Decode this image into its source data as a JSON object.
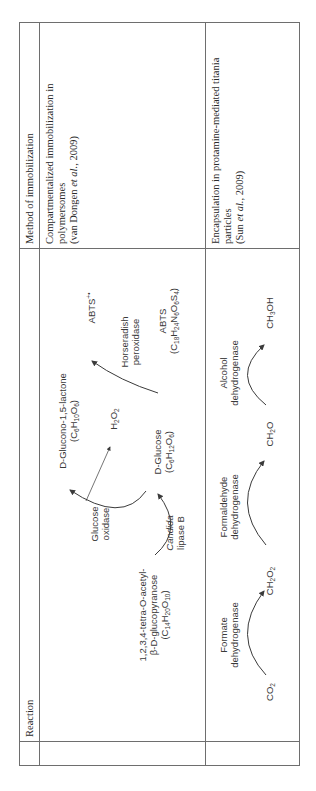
{
  "table": {
    "headers": {
      "reaction": "Reaction",
      "method": "Method of immobilization"
    },
    "rows": [
      {
        "method_lines": [
          "Compartmentalized immobilization in",
          "polymersomes"
        ],
        "citation_prefix": "(van Dongen ",
        "citation_italic": "et al.",
        "citation_suffix": ", 2009)",
        "reaction": {
          "substrate_line1": "1,2,3,4-tetra-O-acetyl-",
          "substrate_line2": "β-D-glucopyranose",
          "substrate_formula": "(C14H20O10)",
          "enzyme1_line1": "Candida",
          "enzyme1_line2": "lipase B",
          "intermediate": "D-Glucose",
          "intermediate_formula": "(C6H12O6)",
          "enzyme2_line1": "Glucose",
          "enzyme2_line2": "oxidase",
          "product": "D-Glucono-1,5-lactone",
          "product_formula": "(C6H10O6)",
          "byproduct": "H2O2",
          "enzyme3_line1": "Horseradish",
          "enzyme3_line2": "peroxidase",
          "dye": "ABTS",
          "dye_formula": "(C18H24N6O6S4)",
          "dye_oxidized": "ABTS+•"
        }
      },
      {
        "method_lines": [
          "Encapsulation in protamine-mediated titania",
          "particles"
        ],
        "citation_prefix": "(Sun ",
        "citation_italic": "et al.",
        "citation_suffix": ", 2009)",
        "reaction": {
          "species": [
            "CO2",
            "CH2O2",
            "CH2O",
            "CH3OH"
          ],
          "enzymes": [
            [
              "Formate",
              "dehydrogenase"
            ],
            [
              "Formaldehyde",
              "dehydrogenase"
            ],
            [
              "Alcohol",
              "dehydrogenase"
            ]
          ]
        }
      }
    ]
  },
  "colors": {
    "border": "#6e6e6e",
    "text": "#2b2b2b",
    "diagram": "#3a3a3a"
  }
}
